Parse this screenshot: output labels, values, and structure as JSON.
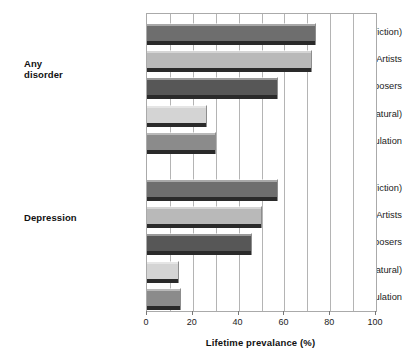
{
  "chart": {
    "xaxis_title": "Lifetime prevalance (%)",
    "groups": [
      {
        "label": "Any\ndisorder"
      },
      {
        "label": "Depression"
      }
    ]
  },
  "chart_data": {
    "type": "bar",
    "orientation": "horizontal",
    "title": "",
    "subtitle": "",
    "xlabel": "Lifetime prevalance (%)",
    "ylabel": "",
    "xlim": [
      0,
      100
    ],
    "xticks": [
      0,
      20,
      40,
      60,
      80,
      100
    ],
    "xtick_labels": [
      "0",
      "20",
      "40",
      "60",
      "80",
      "100"
    ],
    "grid": true,
    "gridlines_every": 10,
    "legend": "none",
    "group_labels": [
      "Any disorder",
      "Depression"
    ],
    "categories": [
      "Writers (fiction)",
      "Artists",
      "Composers",
      "Scientists (natural)",
      "General population"
    ],
    "series": [
      {
        "name": "Any disorder",
        "values": [
          74,
          72,
          57,
          26,
          30
        ]
      },
      {
        "name": "Depression",
        "values": [
          57,
          50,
          46,
          14,
          15
        ]
      }
    ],
    "bar_colors": {
      "Writers (fiction)": "#6e6e6e",
      "Artists": "#b9b9b9",
      "Composers": "#575757",
      "Scientists (natural)": "#d4d4d4",
      "General population": "#8b8b8b"
    },
    "bars": [
      {
        "group": "Any disorder",
        "category": "Writers (fiction)",
        "value": 74,
        "color": "#6e6e6e"
      },
      {
        "group": "Any disorder",
        "category": "Artists",
        "value": 72,
        "color": "#b9b9b9"
      },
      {
        "group": "Any disorder",
        "category": "Composers",
        "value": 57,
        "color": "#575757"
      },
      {
        "group": "Any disorder",
        "category": "Scientists (natural)",
        "value": 26,
        "color": "#d4d4d4"
      },
      {
        "group": "Any disorder",
        "category": "General population",
        "value": 30,
        "color": "#8b8b8b"
      },
      {
        "group": "Depression",
        "category": "Writers (fiction)",
        "value": 57,
        "color": "#6e6e6e"
      },
      {
        "group": "Depression",
        "category": "Artists",
        "value": 50,
        "color": "#b9b9b9"
      },
      {
        "group": "Depression",
        "category": "Composers",
        "value": 46,
        "color": "#575757"
      },
      {
        "group": "Depression",
        "category": "Scientists (natural)",
        "value": 14,
        "color": "#d4d4d4"
      },
      {
        "group": "Depression",
        "category": "General population",
        "value": 15,
        "color": "#8b8b8b"
      }
    ]
  }
}
